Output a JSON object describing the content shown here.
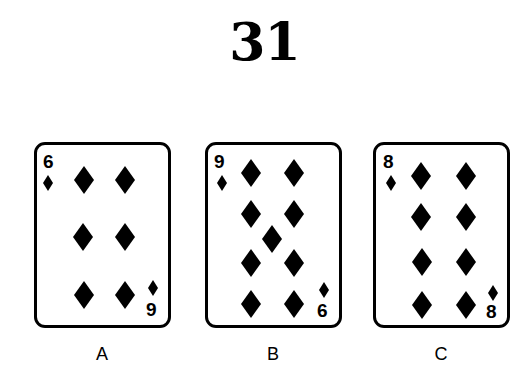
{
  "puzzle": {
    "number": "31"
  },
  "cards": [
    {
      "label": "A",
      "top_index": "6",
      "bottom_index": "9",
      "suit": "diamonds",
      "pip_count": 6
    },
    {
      "label": "B",
      "top_index": "9",
      "bottom_index": "6",
      "suit": "diamonds",
      "pip_count": 9
    },
    {
      "label": "C",
      "top_index": "8",
      "bottom_index": "8",
      "suit": "diamonds",
      "pip_count": 8
    }
  ],
  "colors": {
    "ink": "#000000",
    "background": "#ffffff"
  }
}
